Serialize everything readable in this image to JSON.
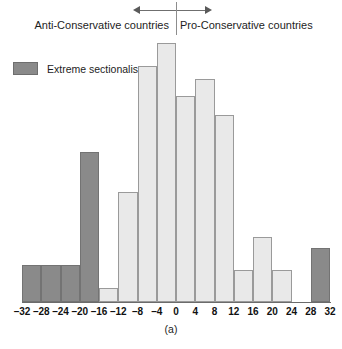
{
  "annotations": {
    "left_label": "Anti-Conservative countries",
    "right_label": "Pro-Conservative countries",
    "left_arrow_icon": "arrow-left-icon",
    "right_arrow_icon": "arrow-right-icon",
    "divider_icon": "vertical-divider-icon"
  },
  "legend": {
    "entries": [
      {
        "label": "Extreme sectionalism",
        "color": "#8a8a8a"
      }
    ],
    "position": "top-left"
  },
  "caption": "(a)",
  "colors": {
    "extreme_sectionalism": "#8a8a8a",
    "normal": "#e9e9e9",
    "outline": "#8f8f8f",
    "axis": "#6b6b6b"
  },
  "chart_data": {
    "type": "bar",
    "title": "",
    "subtitle": "",
    "xlabel": "",
    "ylabel": "",
    "caption": "(a)",
    "grid": false,
    "legend_position": "top-left",
    "xlim": [
      -32,
      32
    ],
    "xticks": [
      -32,
      -28,
      -24,
      -20,
      -16,
      -12,
      -8,
      -4,
      0,
      4,
      8,
      12,
      16,
      20,
      24,
      28,
      32
    ],
    "xtick_labels": [
      "–32",
      "–28",
      "–24",
      "–20",
      "–16",
      "–12",
      "–8",
      "–4",
      "0",
      "4",
      "8",
      "12",
      "16",
      "20",
      "24",
      "28",
      "32"
    ],
    "ylim": [
      0,
      266
    ],
    "yticks": [],
    "bin_width": 4,
    "bins": [
      {
        "start": -32,
        "end": -28,
        "value": 37,
        "group": "extreme_sectionalism"
      },
      {
        "start": -28,
        "end": -24,
        "value": 37,
        "group": "extreme_sectionalism"
      },
      {
        "start": -24,
        "end": -20,
        "value": 37,
        "group": "extreme_sectionalism"
      },
      {
        "start": -20,
        "end": -16,
        "value": 150,
        "group": "extreme_sectionalism"
      },
      {
        "start": -16,
        "end": -12,
        "value": 14,
        "group": "normal"
      },
      {
        "start": -12,
        "end": -8,
        "value": 110,
        "group": "normal"
      },
      {
        "start": -8,
        "end": -4,
        "value": 236,
        "group": "normal"
      },
      {
        "start": -4,
        "end": 0,
        "value": 259,
        "group": "normal"
      },
      {
        "start": 0,
        "end": 4,
        "value": 206,
        "group": "normal"
      },
      {
        "start": 4,
        "end": 8,
        "value": 223,
        "group": "normal"
      },
      {
        "start": 8,
        "end": 12,
        "value": 187,
        "group": "normal"
      },
      {
        "start": 12,
        "end": 16,
        "value": 32,
        "group": "normal"
      },
      {
        "start": 16,
        "end": 20,
        "value": 65,
        "group": "normal"
      },
      {
        "start": 20,
        "end": 24,
        "value": 32,
        "group": "normal"
      },
      {
        "start": 24,
        "end": 28,
        "value": 0,
        "group": "normal"
      },
      {
        "start": 28,
        "end": 32,
        "value": 54,
        "group": "extreme_sectionalism"
      }
    ],
    "annotations": [
      {
        "text": "Anti-Conservative countries",
        "side": "left"
      },
      {
        "text": "Pro-Conservative countries",
        "side": "right"
      }
    ]
  }
}
